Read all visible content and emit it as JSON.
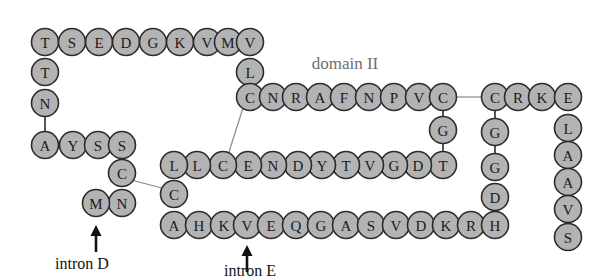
{
  "figure": {
    "type": "protein-sequence-schematic",
    "title_label": "domain II",
    "circle_radius": 13.5,
    "colors": {
      "residue_fill": "#b3b3b3",
      "residue_stroke": "#2b2b2b",
      "bond_line": "#8a8a8a",
      "domain_label": "#6e6e6e",
      "intron_label": "#111111",
      "background": "#ffffff"
    }
  },
  "labels": {
    "domain": "domain II",
    "intron_d": "intron D",
    "intron_e": "intron E"
  },
  "residues": [
    {
      "id": "r1",
      "letter": "T",
      "x": 45,
      "y": 42
    },
    {
      "id": "r2",
      "letter": "S",
      "x": 72,
      "y": 42
    },
    {
      "id": "r3",
      "letter": "E",
      "x": 99,
      "y": 42
    },
    {
      "id": "r4",
      "letter": "D",
      "x": 126,
      "y": 42
    },
    {
      "id": "r5",
      "letter": "G",
      "x": 153,
      "y": 42
    },
    {
      "id": "r6",
      "letter": "K",
      "x": 180,
      "y": 42
    },
    {
      "id": "r7",
      "letter": "V",
      "x": 207,
      "y": 42
    },
    {
      "id": "r8",
      "letter": "M",
      "x": 228,
      "y": 42
    },
    {
      "id": "r9",
      "letter": "V",
      "x": 250,
      "y": 42
    },
    {
      "id": "r10",
      "letter": "T",
      "x": 45,
      "y": 72
    },
    {
      "id": "r11",
      "letter": "N",
      "x": 45,
      "y": 103
    },
    {
      "id": "r12",
      "letter": "A",
      "x": 45,
      "y": 145
    },
    {
      "id": "r13",
      "letter": "Y",
      "x": 73,
      "y": 145
    },
    {
      "id": "r14",
      "letter": "S",
      "x": 98,
      "y": 145
    },
    {
      "id": "r15",
      "letter": "S",
      "x": 122,
      "y": 145
    },
    {
      "id": "r16",
      "letter": "C",
      "x": 122,
      "y": 173
    },
    {
      "id": "r17",
      "letter": "N",
      "x": 122,
      "y": 203
    },
    {
      "id": "r18",
      "letter": "M",
      "x": 96,
      "y": 203
    },
    {
      "id": "r19",
      "letter": "L",
      "x": 250,
      "y": 72
    },
    {
      "id": "r20",
      "letter": "C",
      "x": 250,
      "y": 97
    },
    {
      "id": "r21",
      "letter": "N",
      "x": 273,
      "y": 97
    },
    {
      "id": "r22",
      "letter": "R",
      "x": 296,
      "y": 97
    },
    {
      "id": "r23",
      "letter": "A",
      "x": 320,
      "y": 97
    },
    {
      "id": "r24",
      "letter": "F",
      "x": 344,
      "y": 97
    },
    {
      "id": "r25",
      "letter": "N",
      "x": 369,
      "y": 97
    },
    {
      "id": "r26",
      "letter": "P",
      "x": 394,
      "y": 97
    },
    {
      "id": "r27",
      "letter": "V",
      "x": 419,
      "y": 97
    },
    {
      "id": "r28",
      "letter": "C",
      "x": 443,
      "y": 97
    },
    {
      "id": "r29",
      "letter": "G",
      "x": 443,
      "y": 130
    },
    {
      "id": "r30",
      "letter": "T",
      "x": 443,
      "y": 165
    },
    {
      "id": "r31",
      "letter": "D",
      "x": 418,
      "y": 165
    },
    {
      "id": "r32",
      "letter": "G",
      "x": 394,
      "y": 165
    },
    {
      "id": "r33",
      "letter": "V",
      "x": 370,
      "y": 165
    },
    {
      "id": "r34",
      "letter": "T",
      "x": 346,
      "y": 165
    },
    {
      "id": "r35",
      "letter": "Y",
      "x": 322,
      "y": 165
    },
    {
      "id": "r36",
      "letter": "D",
      "x": 298,
      "y": 165
    },
    {
      "id": "r37",
      "letter": "N",
      "x": 273,
      "y": 165
    },
    {
      "id": "r38",
      "letter": "E",
      "x": 248,
      "y": 165
    },
    {
      "id": "r39",
      "letter": "C",
      "x": 223,
      "y": 165
    },
    {
      "id": "r40",
      "letter": "L",
      "x": 197,
      "y": 165
    },
    {
      "id": "r41",
      "letter": "L",
      "x": 174,
      "y": 165
    },
    {
      "id": "r42",
      "letter": "C",
      "x": 174,
      "y": 194
    },
    {
      "id": "r43",
      "letter": "A",
      "x": 174,
      "y": 225
    },
    {
      "id": "r44",
      "letter": "H",
      "x": 199,
      "y": 225
    },
    {
      "id": "r45",
      "letter": "K",
      "x": 224,
      "y": 225
    },
    {
      "id": "r46",
      "letter": "V",
      "x": 247,
      "y": 225
    },
    {
      "id": "r47",
      "letter": "E",
      "x": 271,
      "y": 225
    },
    {
      "id": "r48",
      "letter": "Q",
      "x": 296,
      "y": 225
    },
    {
      "id": "r49",
      "letter": "G",
      "x": 321,
      "y": 225
    },
    {
      "id": "r50",
      "letter": "A",
      "x": 346,
      "y": 225
    },
    {
      "id": "r51",
      "letter": "S",
      "x": 371,
      "y": 225
    },
    {
      "id": "r52",
      "letter": "V",
      "x": 396,
      "y": 225
    },
    {
      "id": "r53",
      "letter": "D",
      "x": 421,
      "y": 225
    },
    {
      "id": "r54",
      "letter": "K",
      "x": 446,
      "y": 225
    },
    {
      "id": "r55",
      "letter": "R",
      "x": 471,
      "y": 225
    },
    {
      "id": "r56",
      "letter": "H",
      "x": 495,
      "y": 225
    },
    {
      "id": "r57",
      "letter": "D",
      "x": 495,
      "y": 197
    },
    {
      "id": "r58",
      "letter": "G",
      "x": 495,
      "y": 167
    },
    {
      "id": "r59",
      "letter": "G",
      "x": 495,
      "y": 132
    },
    {
      "id": "r60",
      "letter": "C",
      "x": 495,
      "y": 97
    },
    {
      "id": "r61",
      "letter": "R",
      "x": 518,
      "y": 97
    },
    {
      "id": "r62",
      "letter": "K",
      "x": 542,
      "y": 97
    },
    {
      "id": "r63",
      "letter": "E",
      "x": 568,
      "y": 97
    },
    {
      "id": "r64",
      "letter": "L",
      "x": 568,
      "y": 128
    },
    {
      "id": "r65",
      "letter": "A",
      "x": 568,
      "y": 155
    },
    {
      "id": "r66",
      "letter": "A",
      "x": 568,
      "y": 182
    },
    {
      "id": "r67",
      "letter": "V",
      "x": 568,
      "y": 209
    },
    {
      "id": "r68",
      "letter": "S",
      "x": 568,
      "y": 237
    }
  ],
  "disulfide_bonds": [
    {
      "id": "bond-c16-c42",
      "x1": 131,
      "y1": 180,
      "x2": 166,
      "y2": 189
    },
    {
      "id": "bond-c20-c39",
      "x1": 243,
      "y1": 108,
      "x2": 228,
      "y2": 155
    },
    {
      "id": "bond-c28-c60",
      "x1": 457,
      "y1": 97,
      "x2": 481,
      "y2": 97
    }
  ],
  "annotations": [
    {
      "id": "intron-d",
      "label": "intron D",
      "arrow_x": 96,
      "arrow_top": 225,
      "arrow_bottom": 252,
      "label_x": 82,
      "label_y": 263
    },
    {
      "id": "intron-e",
      "label": "intron E",
      "arrow_x": 247,
      "arrow_top": 245,
      "arrow_bottom": 272,
      "label_x": 250,
      "label_y": 270
    }
  ],
  "domain_label_pos": {
    "x": 345,
    "y": 63
  }
}
